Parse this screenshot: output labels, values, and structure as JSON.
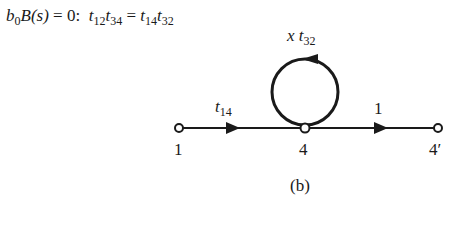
{
  "equation": {
    "lhs_b": "b",
    "lhs_b_sub": "0",
    "lhs_B": "B",
    "lhs_arg": "(s)",
    "eq_zero": " = 0:  ",
    "t1": "t",
    "t1_sub": "12",
    "t2": "t",
    "t2_sub": "34",
    "equals": " = ",
    "t3": "t",
    "t3_sub": "14",
    "t4": "t",
    "t4_sub": "32"
  },
  "graph": {
    "nodes": [
      {
        "id": "1",
        "label": "1"
      },
      {
        "id": "4",
        "label": "4"
      },
      {
        "id": "4p",
        "label": "4′"
      }
    ],
    "edges": [
      {
        "from": "1",
        "to": "4",
        "label_var": "t",
        "label_sub": "14"
      },
      {
        "from": "4",
        "to": "4p",
        "label": "1"
      },
      {
        "from": "4",
        "to": "4",
        "type": "self-loop",
        "label_prefix": "x ",
        "label_var": "t",
        "label_sub": "32"
      }
    ]
  },
  "caption": "(b)"
}
